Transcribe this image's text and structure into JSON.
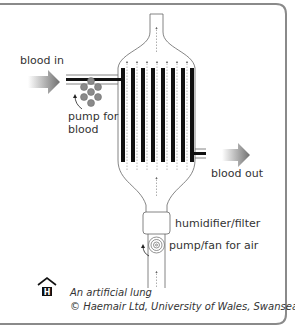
{
  "diagram": {
    "title": "An artificial lung",
    "labels": {
      "blood_in": "blood in",
      "pump_for_blood_line1": "pump for",
      "pump_for_blood_line2": "blood",
      "blood_out": "blood out",
      "humidifier": "humidifier/filter",
      "pump_fan": "pump/fan for air"
    },
    "caption": {
      "line1": "An artificial lung",
      "line2": "© Haemair Ltd, University of Wales, Swansea"
    },
    "logo": {
      "icon": "haemair-house-h-logo",
      "letter": "H"
    },
    "colors": {
      "frame": "#888888",
      "tube": "#111111",
      "outline": "#666666",
      "pump_ball": "#888888",
      "arrow_gradient_start": "#ffffff",
      "arrow_gradient_end": "#777777",
      "text": "#333333"
    },
    "hollow_fibres_count": 8
  }
}
